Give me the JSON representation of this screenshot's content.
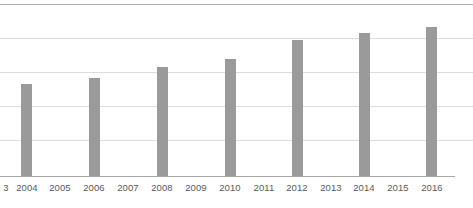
{
  "chart_data": {
    "type": "bar",
    "title": "",
    "subtitle": "",
    "xlabel": "",
    "ylabel": "",
    "grid": true,
    "legend": null,
    "legend_position": "none",
    "bar_color": "#9a9a9a",
    "gridline_color": "#dcdcdc",
    "axis_color": "#a8a8a8",
    "label_color": "#5a5a5a",
    "background_color": "#ffffff",
    "axis_tick_labels": [
      "3",
      "2004",
      "2005",
      "2006",
      "2007",
      "2008",
      "2009",
      "2010",
      "2011",
      "2012",
      "2013",
      "2014",
      "2015",
      "2016"
    ],
    "categories": [
      "2004",
      "2005",
      "2006",
      "2007",
      "2008",
      "2009",
      "2010",
      "2011",
      "2012",
      "2013",
      "2014",
      "2015",
      "2016"
    ],
    "values": [
      54,
      null,
      57,
      null,
      63,
      null,
      68,
      null,
      79,
      null,
      83,
      null,
      87
    ],
    "ylim": [
      0,
      100
    ],
    "y_gridline_values": [
      100,
      80,
      60,
      40,
      20,
      0
    ],
    "note": "Bars are plotted only for even-numbered years; odd years have no bar. Values estimated from gridline spacing where 0 is the baseline and each gridline step is 20 units.",
    "bars": [
      {
        "category": "2004",
        "value": 54,
        "left": 21,
        "top": 84,
        "height": 92
      },
      {
        "category": "2006",
        "value": 57,
        "left": 89,
        "top": 78,
        "height": 98
      },
      {
        "category": "2008",
        "value": 63,
        "left": 157,
        "top": 67,
        "height": 109
      },
      {
        "category": "2010",
        "value": 68,
        "left": 225,
        "top": 59,
        "height": 117
      },
      {
        "category": "2012",
        "value": 79,
        "left": 292,
        "top": 40,
        "height": 136
      },
      {
        "category": "2014",
        "value": 83,
        "left": 359,
        "top": 33,
        "height": 143
      },
      {
        "category": "2016",
        "value": 87,
        "left": 426,
        "top": 27,
        "height": 149
      }
    ],
    "gridlines": [
      {
        "value": 100,
        "top": 4,
        "emphasis": true
      },
      {
        "value": 80,
        "top": 38,
        "emphasis": false
      },
      {
        "value": 60,
        "top": 72,
        "emphasis": false
      },
      {
        "value": 40,
        "top": 106,
        "emphasis": false
      },
      {
        "value": 20,
        "top": 140,
        "emphasis": false
      }
    ],
    "tick_positions": [
      {
        "label": "3",
        "center": 6
      },
      {
        "label": "2004",
        "center": 27
      },
      {
        "label": "2005",
        "center": 60
      },
      {
        "label": "2006",
        "center": 94
      },
      {
        "label": "2007",
        "center": 128
      },
      {
        "label": "2008",
        "center": 162
      },
      {
        "label": "2009",
        "center": 196
      },
      {
        "label": "2010",
        "center": 230
      },
      {
        "label": "2011",
        "center": 264
      },
      {
        "label": "2012",
        "center": 297
      },
      {
        "label": "2013",
        "center": 331
      },
      {
        "label": "2014",
        "center": 364
      },
      {
        "label": "2015",
        "center": 398
      },
      {
        "label": "2016",
        "center": 432
      }
    ]
  }
}
